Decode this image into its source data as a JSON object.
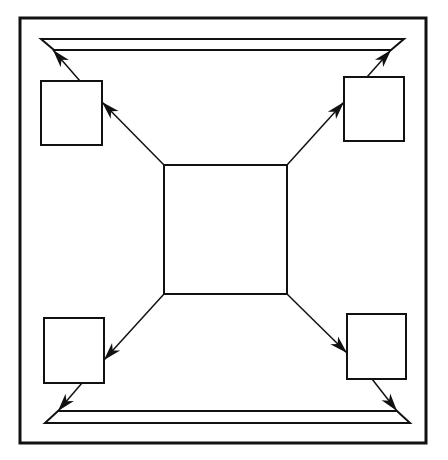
{
  "diagram": {
    "type": "block-flow",
    "colors": {
      "stroke": "#111111",
      "background": "#ffffff"
    },
    "frame": {
      "x": 20,
      "y": 18,
      "width": 406,
      "height": 425
    },
    "nodes": [
      {
        "id": "center",
        "label": "",
        "x": 164,
        "y": 165,
        "width": 123,
        "height": 129
      },
      {
        "id": "top-left",
        "label": "",
        "x": 41,
        "y": 81,
        "width": 61,
        "height": 64
      },
      {
        "id": "top-right",
        "label": "",
        "x": 344,
        "y": 77,
        "width": 60,
        "height": 64
      },
      {
        "id": "bottom-left",
        "label": "",
        "x": 44,
        "y": 318,
        "width": 60,
        "height": 65
      },
      {
        "id": "bottom-right",
        "label": "",
        "x": 347,
        "y": 314,
        "width": 59,
        "height": 65
      }
    ],
    "rails": [
      {
        "id": "top-rail",
        "outer": {
          "x1": 41,
          "x2": 404,
          "y": 39
        },
        "inner": {
          "x1": 54,
          "x2": 391,
          "y": 50
        }
      },
      {
        "id": "bottom-rail",
        "outer": {
          "x1": 45,
          "x2": 410,
          "y": 423
        },
        "inner": {
          "x1": 58,
          "x2": 397,
          "y": 411
        }
      }
    ],
    "edges": [
      {
        "from": "center",
        "to": "top-left",
        "x1": 164,
        "y1": 165,
        "x2": 102,
        "y2": 102
      },
      {
        "from": "center",
        "to": "top-right",
        "x1": 287,
        "y1": 165,
        "x2": 344,
        "y2": 102
      },
      {
        "from": "center",
        "to": "bottom-left",
        "x1": 164,
        "y1": 294,
        "x2": 104,
        "y2": 360
      },
      {
        "from": "center",
        "to": "bottom-right",
        "x1": 287,
        "y1": 294,
        "x2": 347,
        "y2": 353
      },
      {
        "from": "top-left",
        "to": "top-rail",
        "x1": 80,
        "y1": 81,
        "x2": 53,
        "y2": 50
      },
      {
        "from": "top-right",
        "to": "top-rail",
        "x1": 367,
        "y1": 77,
        "x2": 391,
        "y2": 50
      },
      {
        "from": "bottom-left",
        "to": "bottom-rail",
        "x1": 82,
        "y1": 383,
        "x2": 58,
        "y2": 411
      },
      {
        "from": "bottom-right",
        "to": "bottom-rail",
        "x1": 372,
        "y1": 379,
        "x2": 397,
        "y2": 411
      }
    ]
  }
}
